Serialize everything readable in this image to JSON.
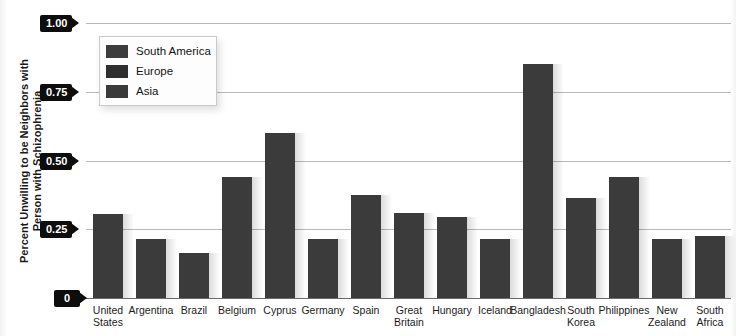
{
  "chart_data": {
    "type": "bar",
    "title": "",
    "xlabel": "",
    "ylabel": "Percent Unwilling to be Neighbors with Person with Schizophrenia",
    "ylim": [
      0,
      1.0
    ],
    "ytick_labels": [
      "1.00",
      "0.75",
      "0.50",
      "0.25",
      "0"
    ],
    "ytick_values": [
      1.0,
      0.75,
      0.5,
      0.25,
      0
    ],
    "grid": true,
    "legend_position": "upper-left",
    "categories": [
      "United States",
      "Argentina",
      "Brazil",
      "Belgium",
      "Cyprus",
      "Germany",
      "Spain",
      "Great Britain",
      "Hungary",
      "Iceland",
      "Bangladesh",
      "South Korea",
      "Philippines",
      "New Zealand",
      "South Africa"
    ],
    "values": [
      0.305,
      0.215,
      0.165,
      0.44,
      0.6,
      0.215,
      0.375,
      0.31,
      0.295,
      0.215,
      0.85,
      0.365,
      0.44,
      0.215,
      0.225
    ],
    "groups": [
      "North America",
      "South America",
      "South America",
      "Europe",
      "Europe",
      "Europe",
      "Europe",
      "Europe",
      "Europe",
      "Europe",
      "Asia",
      "Asia",
      "Asia",
      "Oceania",
      "Africa"
    ],
    "bar_color": "#3b3b3b",
    "legend": [
      {
        "label": "South America",
        "color": "#3d3d3d"
      },
      {
        "label": "Europe",
        "color": "#2f2f2f"
      },
      {
        "label": "Asia",
        "color": "#3a3a3a"
      }
    ]
  },
  "axis": {
    "ylabel_line1": "Percent Unwilling to be Neighbors with",
    "ylabel_line2": "Person with Schizophrenia"
  },
  "colors": {
    "gridline": "#b9b9b9",
    "baseline": "#6b6b6b",
    "tick_tag_bg": "#0d0d0d",
    "tick_tag_fg": "#ffffff",
    "background": "#ffffff"
  }
}
